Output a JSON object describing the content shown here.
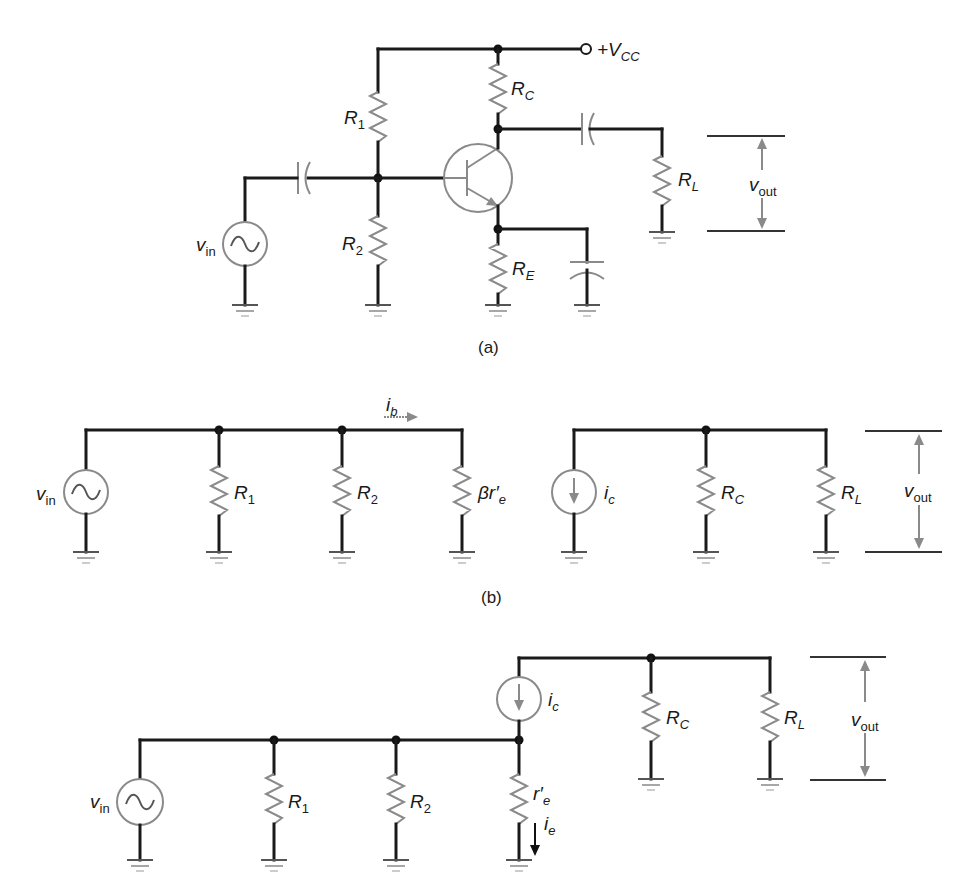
{
  "figure": {
    "parts": [
      {
        "id": "a",
        "caption": "(a)",
        "description": "Voltage-divider biased common-emitter amplifier",
        "labels": {
          "vcc_prefix": "+V",
          "vcc_sub": "CC",
          "r1": "R",
          "r1_sub": "1",
          "r2": "R",
          "r2_sub": "2",
          "rc": "R",
          "rc_sub": "C",
          "re": "R",
          "re_sub": "E",
          "rl": "R",
          "rl_sub": "L",
          "vin": "v",
          "vin_sub": "in",
          "vout": "v",
          "vout_sub": "out"
        }
      },
      {
        "id": "b",
        "caption": "(b)",
        "description": "AC equivalent circuit with beta r'e input model",
        "labels": {
          "vin": "v",
          "vin_sub": "in",
          "r1": "R",
          "r1_sub": "1",
          "r2": "R",
          "r2_sub": "2",
          "bre": "βr′",
          "bre_sub": "e",
          "ib": "i",
          "ib_sub": "b",
          "ic": "i",
          "ic_sub": "c",
          "rc": "R",
          "rc_sub": "C",
          "rl": "R",
          "rl_sub": "L",
          "vout": "v",
          "vout_sub": "out"
        }
      },
      {
        "id": "c",
        "caption": "",
        "description": "AC equivalent circuit with r'e emitter model",
        "labels": {
          "vin": "v",
          "vin_sub": "in",
          "r1": "R",
          "r1_sub": "1",
          "r2": "R",
          "r2_sub": "2",
          "re": "r′",
          "re_sub": "e",
          "ie": "i",
          "ie_sub": "e",
          "ic": "i",
          "ic_sub": "c",
          "rc": "R",
          "rc_sub": "C",
          "rl": "R",
          "rl_sub": "L",
          "vout": "v",
          "vout_sub": "out"
        }
      }
    ]
  }
}
